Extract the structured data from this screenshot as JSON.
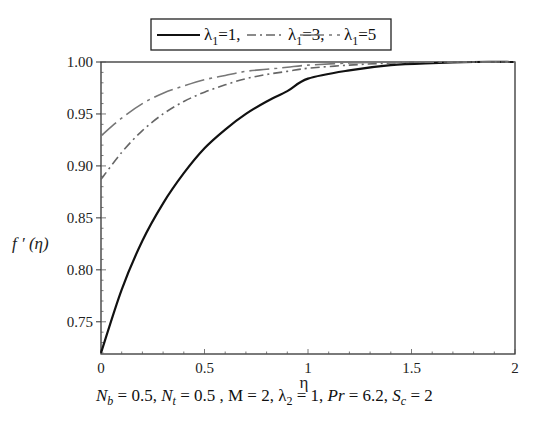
{
  "chart_data": {
    "type": "line",
    "title": "",
    "xlabel": "η",
    "ylabel": "f′(η)",
    "xlim": [
      0,
      2
    ],
    "ylim": [
      0.719,
      1.0
    ],
    "grid": false,
    "legend_position": "top (boxed, above plot)",
    "x_ticks": [
      "0",
      "0.5",
      "1",
      "1.5",
      "2"
    ],
    "y_ticks": [
      "0.75",
      "0.80",
      "0.85",
      "0.90",
      "0.95",
      "1.00"
    ],
    "x": [
      0,
      0.1,
      0.2,
      0.3,
      0.4,
      0.5,
      0.6,
      0.7,
      0.8,
      0.9,
      1.0,
      1.2,
      1.4,
      1.6,
      1.8,
      2.0
    ],
    "series": [
      {
        "name": "λ1=1",
        "style": "solid",
        "color": "#111111",
        "values": [
          0.72,
          0.781,
          0.828,
          0.864,
          0.893,
          0.917,
          0.935,
          0.95,
          0.962,
          0.972,
          0.984,
          0.992,
          0.997,
          0.999,
          1.0,
          1.0
        ]
      },
      {
        "name": "λ1=3",
        "style": "dash-dot",
        "color": "#666666",
        "values": [
          0.887,
          0.913,
          0.934,
          0.95,
          0.962,
          0.971,
          0.978,
          0.984,
          0.988,
          0.991,
          0.994,
          0.997,
          0.999,
          1.0,
          1.0,
          1.0
        ]
      },
      {
        "name": "λ1=5",
        "style": "long-dash",
        "color": "#777777",
        "values": [
          0.929,
          0.946,
          0.96,
          0.97,
          0.977,
          0.983,
          0.987,
          0.991,
          0.993,
          0.995,
          0.997,
          0.999,
          1.0,
          1.0,
          1.0,
          1.0
        ]
      }
    ],
    "annotation": "Nb = 0.5, Nt = 0.5 , M = 2, λ2 = 1, Pr = 6.2, Sc = 2"
  },
  "legend": {
    "items": [
      {
        "symbol": "λ",
        "sub": "1",
        "text": "=1,"
      },
      {
        "symbol": "λ",
        "sub": "1",
        "text": "=3,"
      },
      {
        "symbol": "λ",
        "sub": "1",
        "text": "=5"
      }
    ]
  },
  "axes": {
    "ylabel_main": "f ′ (η)",
    "xlabel": "η"
  },
  "params": {
    "nb_var": "N",
    "nb_sub": "b",
    "nb_val": " = 0.5, ",
    "nt_var": "N",
    "nt_sub": "t",
    "nt_val": " = 0.5 , M = 2, ",
    "l2_var": "λ",
    "l2_sub": "2",
    "l2_val": " = 1, ",
    "pr_var": "Pr",
    "pr_val": " = 6.2, ",
    "sc_var": "S",
    "sc_sub": "c",
    "sc_val": " = 2"
  }
}
